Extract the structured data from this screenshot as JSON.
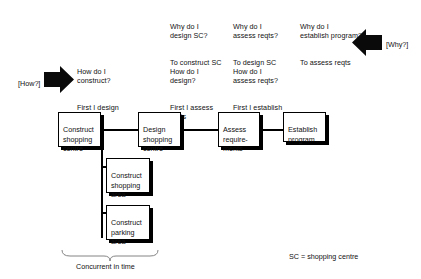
{
  "diagram": {
    "why_blocks": [
      {
        "question": "Why do I\ndesign SC?",
        "answer": "To construct SC"
      },
      {
        "question": "Why do I\nassess reqts?",
        "answer": "To design SC"
      },
      {
        "question": "Why do I\nestablish program?",
        "answer": "To assess reqts"
      }
    ],
    "how_blocks": [
      {
        "question": "How do I\nconstruct?",
        "answer": "First I design"
      },
      {
        "question": "How do I\ndesign?",
        "answer": "First I assess\nreqts"
      },
      {
        "question": "How do I\nassess reqts?",
        "answer": "First I establish\nprogram"
      }
    ],
    "how_tag": "[How?]",
    "why_tag": "[Why?]",
    "main_nodes": [
      {
        "label": "Construct\nshopping\ncentre"
      },
      {
        "label": "Design\nshopping\ncentre"
      },
      {
        "label": "Assess\nrequire-\nments"
      },
      {
        "label": "Establish\nprogram"
      }
    ],
    "sub_nodes": [
      {
        "label": "Construct\nshopping\narea"
      },
      {
        "label": "Construct\nparking\narea"
      }
    ],
    "brace_label": "Concurrent in time",
    "legend": "SC = shopping centre",
    "colors": {
      "ink": "#000000",
      "paper": "#ffffff"
    }
  }
}
